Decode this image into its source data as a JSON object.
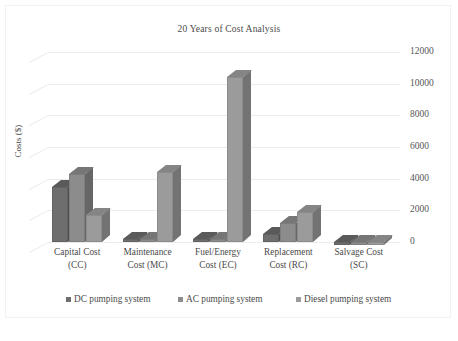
{
  "chart_data": {
    "type": "bar",
    "title": "20 Years of Cost Analysis",
    "xlabel": "",
    "ylabel": "Costs ($)",
    "ylim": [
      0,
      12000
    ],
    "yticks": [
      12000,
      10000,
      8000,
      6000,
      4000,
      2000,
      0
    ],
    "ytick_labels": [
      "12000",
      "10000",
      "8000",
      "6000",
      "4000",
      "2000",
      "0"
    ],
    "grid": true,
    "legend_position": "bottom",
    "three_d": true,
    "categories": [
      "Capital Cost (CC)",
      "Maintenance Cost (MC)",
      "Fuel/Energy Cost (EC)",
      "Replacement Cost (RC)",
      "Salvage Cost (SC)"
    ],
    "category_lines": [
      [
        "Capital Cost",
        "(CC)"
      ],
      [
        "Maintenance",
        "Cost (MC)"
      ],
      [
        "Fuel/Energy",
        "Cost (EC)"
      ],
      [
        "Replacement",
        "Cost (RC)"
      ],
      [
        "Salvage Cost",
        "(SC)"
      ]
    ],
    "series": [
      {
        "name": "DC pumping system",
        "color": "#6e6e6e",
        "top_color": "#5a5a5a",
        "side_color": "#4f4f4f",
        "values": [
          3500,
          60,
          60,
          500,
          -220
        ]
      },
      {
        "name": "AC pumping system",
        "color": "#8c8c8c",
        "top_color": "#767676",
        "side_color": "#666666",
        "values": [
          4300,
          60,
          60,
          1200,
          -220
        ]
      },
      {
        "name": "Diesel pumping system",
        "color": "#9b9b9b",
        "top_color": "#858585",
        "side_color": "#737373",
        "values": [
          1700,
          4400,
          10400,
          1900,
          -220
        ]
      }
    ]
  },
  "legend": {
    "items": [
      {
        "label": "DC pumping system",
        "color": "#6e6e6e"
      },
      {
        "label": "AC pumping system",
        "color": "#8c8c8c"
      },
      {
        "label": "Diesel pumping system",
        "color": "#9b9b9b"
      }
    ]
  }
}
